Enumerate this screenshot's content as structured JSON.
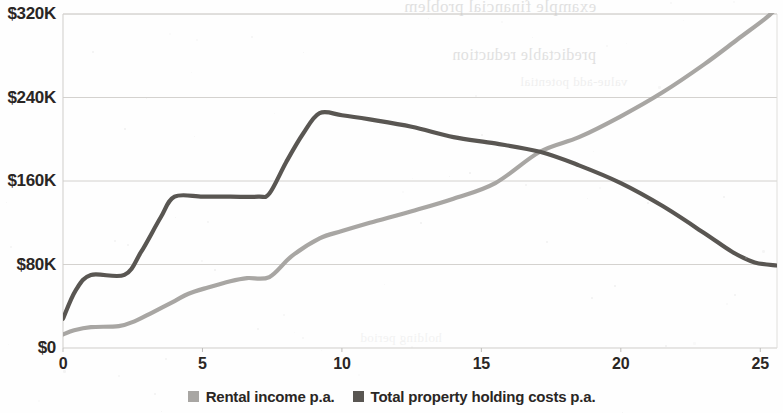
{
  "chart_data": {
    "type": "line",
    "title": "",
    "subtitle": "",
    "xlabel": "",
    "ylabel": "",
    "xlim": [
      0,
      25.6
    ],
    "ylim": [
      0,
      320
    ],
    "y_unit": "thousands of dollars",
    "grid": "horizontal",
    "legend_position": "bottom-center",
    "x_ticks": [
      0,
      5,
      10,
      15,
      20,
      25
    ],
    "x_tick_labels": [
      "0",
      "5",
      "10",
      "15",
      "20",
      "25"
    ],
    "y_ticks": [
      0,
      80,
      160,
      240,
      320
    ],
    "y_tick_labels": [
      "$0",
      "$80K",
      "$160K",
      "$240K",
      "$320K"
    ],
    "series": [
      {
        "name": "Rental income p.a.",
        "color": "#a8a6a3",
        "x": [
          0,
          0.4,
          1.0,
          2.0,
          2.6,
          3.2,
          4.0,
          4.5,
          5.2,
          6.0,
          6.6,
          7.4,
          8.2,
          9.2,
          10.0,
          11.0,
          12.5,
          14.0,
          15.5,
          17.1,
          18.5,
          20.0,
          21.5,
          23.0,
          24.2,
          25.2,
          25.6
        ],
        "values": [
          13,
          17,
          20,
          21,
          26,
          34,
          45,
          52,
          58,
          64,
          67,
          68,
          88,
          105,
          112,
          120,
          131,
          143,
          158,
          188,
          202,
          222,
          245,
          272,
          296,
          316,
          326
        ]
      },
      {
        "name": "Total property holding costs p.a.",
        "color": "#595652",
        "x": [
          0,
          0.45,
          1.0,
          2.2,
          2.8,
          3.5,
          4.0,
          5.0,
          6.0,
          7.0,
          7.4,
          8.0,
          8.6,
          9.2,
          10.0,
          11.0,
          12.5,
          14.0,
          15.5,
          17.1,
          18.5,
          20.0,
          21.5,
          23.0,
          24.0,
          24.8,
          25.6
        ],
        "values": [
          28,
          55,
          70,
          70,
          92,
          125,
          145,
          145,
          145,
          145,
          148,
          178,
          205,
          225,
          223,
          219,
          212,
          202,
          196,
          188,
          175,
          158,
          136,
          110,
          92,
          82,
          79
        ]
      }
    ],
    "annotations": [
      {
        "type": "crossover",
        "x": 17.1,
        "y": 188,
        "description": "Rental income p.a. overtakes Total property holding costs p.a."
      }
    ]
  },
  "legend": {
    "items": [
      {
        "label": "Rental income p.a.",
        "color": "#a8a6a3"
      },
      {
        "label": "Total property holding costs p.a.",
        "color": "#595652"
      }
    ]
  },
  "scan_artifacts": {
    "description": "faint mirrored bleed-through text from the reverse side of the scanned page",
    "lines": [
      "example financial problem",
      "predictable reduction",
      "value-add potential",
      "holding period"
    ]
  }
}
